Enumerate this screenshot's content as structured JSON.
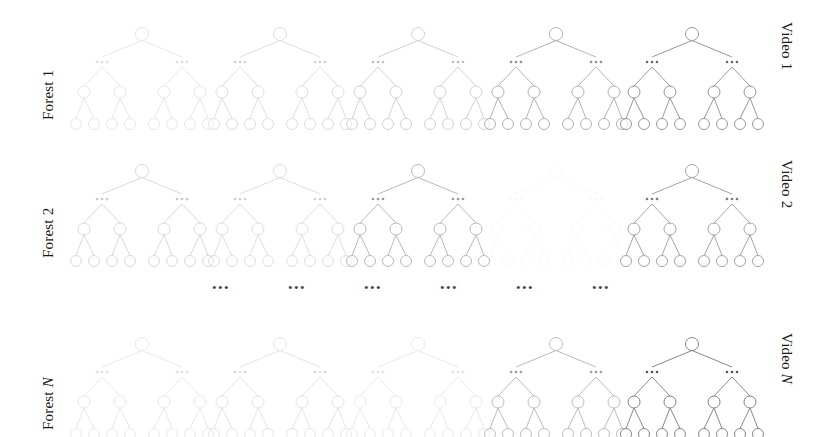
{
  "figure": {
    "type": "diagram",
    "width": 836,
    "height": 437,
    "background_color": "#ffffff",
    "node_stroke_color": "#6e6e6e",
    "edge_stroke_color": "#6e6e6e",
    "ellipsis_color": "#2b2b2b",
    "ellipsis_glyph": "•••"
  },
  "rows": [
    {
      "left_label_prefix": "Forest ",
      "left_label_suffix": "1",
      "left_label_italic": false,
      "right_label_prefix": "Video ",
      "right_label_suffix": "1",
      "right_label_italic": false,
      "top": 8,
      "label_left_x": 40,
      "label_left_y": 120,
      "label_right_x": 795,
      "label_right_y": 22,
      "trees": [
        {
          "index": 1,
          "x": 70,
          "opacity": 0.16
        },
        {
          "index": 2,
          "x": 208,
          "opacity": 0.22
        },
        {
          "index": 3,
          "x": 346,
          "opacity": 0.3
        },
        {
          "index": 4,
          "x": 484,
          "opacity": 0.52
        },
        {
          "index": 5,
          "x": 620,
          "opacity": 0.7
        }
      ]
    },
    {
      "left_label_prefix": "Forest ",
      "left_label_suffix": "2",
      "left_label_italic": false,
      "right_label_prefix": "Video ",
      "right_label_suffix": "2",
      "right_label_italic": false,
      "top": 145,
      "label_left_x": 40,
      "label_left_y": 258,
      "label_right_x": 795,
      "label_right_y": 160,
      "trees": [
        {
          "index": 1,
          "x": 70,
          "opacity": 0.26
        },
        {
          "index": 2,
          "x": 208,
          "opacity": 0.22
        },
        {
          "index": 3,
          "x": 346,
          "opacity": 0.48
        },
        {
          "index": 4,
          "x": 484,
          "opacity": 0.03
        },
        {
          "index": 5,
          "x": 620,
          "opacity": 0.62
        }
      ]
    },
    {
      "left_label_prefix": "Forest ",
      "left_label_suffix": "N",
      "left_label_italic": true,
      "right_label_prefix": "Video ",
      "right_label_suffix": "N",
      "right_label_italic": true,
      "top": 318,
      "label_left_x": 40,
      "label_left_y": 430,
      "label_right_x": 795,
      "label_right_y": 333,
      "trees": [
        {
          "index": 1,
          "x": 70,
          "opacity": 0.15
        },
        {
          "index": 2,
          "x": 208,
          "opacity": 0.18
        },
        {
          "index": 3,
          "x": 346,
          "opacity": 0.14
        },
        {
          "index": 4,
          "x": 484,
          "opacity": 0.46
        },
        {
          "index": 5,
          "x": 620,
          "opacity": 0.82
        }
      ]
    }
  ],
  "middle_ellipsis_row": {
    "top": 281,
    "items": [
      {
        "x": 212,
        "opacity": 0.88
      },
      {
        "x": 288,
        "opacity": 0.88
      },
      {
        "x": 364,
        "opacity": 0.88
      },
      {
        "x": 440,
        "opacity": 0.88
      },
      {
        "x": 516,
        "opacity": 0.88
      },
      {
        "x": 592,
        "opacity": 0.88
      }
    ]
  },
  "tree_geometry": {
    "width": 136,
    "height": 122,
    "root": {
      "x": 68,
      "y": 26
    },
    "ellipsis_level_y": 54,
    "ellipsis_positions_x": [
      28,
      108
    ],
    "mid_level_y": 84,
    "mid_positions_x": [
      10,
      46,
      90,
      126
    ],
    "leaf_level_y": 116,
    "leaf_positions_x": [
      2,
      20,
      38,
      56,
      80,
      98,
      116,
      134
    ],
    "node_radius_root": 6.5,
    "node_radius_mid": 6,
    "node_radius_leaf": 5.5
  }
}
